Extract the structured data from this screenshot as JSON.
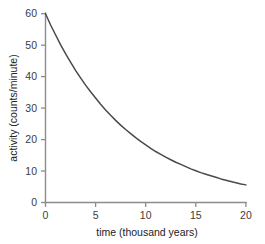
{
  "chart_data": {
    "type": "line",
    "title": "",
    "subtitle": "",
    "xlabel": "time (thousand years)",
    "ylabel": "activity (counts/minute)",
    "xlim": [
      0,
      20
    ],
    "ylim": [
      0,
      60
    ],
    "xticks": [
      0,
      5,
      10,
      15,
      20
    ],
    "yticks": [
      0,
      10,
      20,
      30,
      40,
      50,
      60
    ],
    "xtick_labels": [
      "0",
      "5",
      "10",
      "15",
      "20"
    ],
    "ytick_labels": [
      "0",
      "10",
      "20",
      "30",
      "40",
      "50",
      "60"
    ],
    "grid": false,
    "legend": "none",
    "annotations": [],
    "series": [
      {
        "name": "activity",
        "color": "#4a4a4a",
        "description": "exponential decay, A = 60 * exp(-0.1187 * t)",
        "x": [
          0,
          0.5,
          1,
          1.5,
          2,
          2.5,
          3,
          3.5,
          4,
          4.5,
          5,
          5.5,
          6,
          6.5,
          7,
          7.5,
          8,
          8.5,
          9,
          9.5,
          10,
          10.5,
          11,
          11.5,
          12,
          12.5,
          13,
          13.5,
          14,
          14.5,
          15,
          15.5,
          16,
          16.5,
          17,
          17.5,
          18,
          18.5,
          19,
          19.5,
          20
        ],
        "y": [
          60.0,
          56.5,
          53.3,
          50.2,
          47.3,
          44.6,
          42.0,
          39.6,
          37.3,
          35.2,
          33.2,
          31.2,
          29.4,
          27.7,
          26.1,
          24.6,
          23.2,
          21.9,
          20.6,
          19.4,
          18.3,
          17.2,
          16.2,
          15.3,
          14.4,
          13.6,
          12.8,
          12.1,
          11.4,
          10.7,
          10.1,
          9.5,
          9.0,
          8.5,
          8.0,
          7.5,
          7.1,
          6.7,
          6.3,
          5.9,
          5.6
        ]
      }
    ],
    "colors": {
      "curve": "#4a4a4a",
      "axis": "#8c8c8c",
      "text": "#3b3b3b",
      "background": "#ffffff"
    }
  }
}
